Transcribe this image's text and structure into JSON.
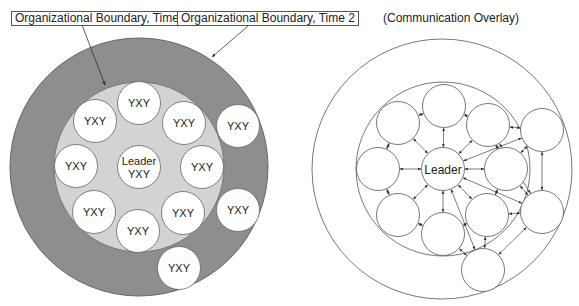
{
  "labels": {
    "boundary_time1": "Organizational Boundary, Time 1",
    "boundary_time2": "Organizational Boundary, Time 2",
    "overlay_title": "(Communication Overlay)"
  },
  "colors": {
    "outer_ring": "#8e8e8e",
    "inner_area": "#d3d3d3",
    "member_fill": "#ffffff",
    "stroke": "#555555"
  },
  "left_diagram": {
    "leader": {
      "line1": "Leader",
      "line2": "YXY"
    },
    "member_label": "YXY",
    "inner_members": [
      {
        "cx": 139,
        "cy": 103
      },
      {
        "cx": 184,
        "cy": 123
      },
      {
        "cx": 202,
        "cy": 167
      },
      {
        "cx": 183,
        "cy": 213
      },
      {
        "cx": 138,
        "cy": 231
      },
      {
        "cx": 94,
        "cy": 212
      },
      {
        "cx": 76,
        "cy": 166
      },
      {
        "cx": 95,
        "cy": 121
      }
    ],
    "outer_members": [
      {
        "cx": 238,
        "cy": 126
      },
      {
        "cx": 238,
        "cy": 210
      },
      {
        "cx": 179,
        "cy": 268
      }
    ]
  },
  "right_diagram": {
    "leader_label": "Leader"
  }
}
